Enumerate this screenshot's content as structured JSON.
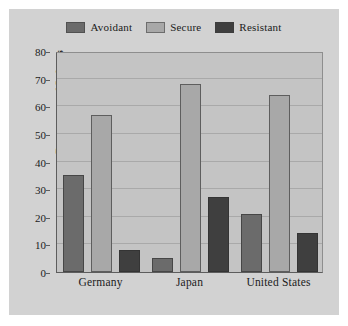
{
  "chart_data": {
    "type": "bar",
    "title": "",
    "xlabel": "",
    "ylabel": "Percentage of Infants",
    "categories": [
      "Germany",
      "Japan",
      "United States"
    ],
    "series": [
      {
        "name": "Avoidant",
        "color": "#6b6b6b",
        "values": [
          35,
          5,
          21
        ]
      },
      {
        "name": "Secure",
        "color": "#a8a8a8",
        "values": [
          57,
          68,
          64
        ]
      },
      {
        "name": "Resistant",
        "color": "#3f3f3f",
        "values": [
          8,
          27,
          14
        ]
      }
    ],
    "ylim": [
      0,
      80
    ],
    "yticks": [
      0,
      10,
      20,
      30,
      40,
      50,
      60,
      70,
      80
    ],
    "ytick_labels": [
      "0",
      "10",
      "20",
      "30",
      "40",
      "50",
      "60",
      "70",
      "80"
    ],
    "grid": true,
    "legend_position": "top-center"
  },
  "legend": {
    "entries": [
      {
        "label": "Avoidant"
      },
      {
        "label": "Secure"
      },
      {
        "label": "Resistant"
      }
    ]
  },
  "colors": {
    "panel_background": "#d2d2d2",
    "plot_background": "#c4c4c4",
    "gridline": "#a9a9a9",
    "axis": "#5d5d5d",
    "text": "#1b1b1b"
  }
}
